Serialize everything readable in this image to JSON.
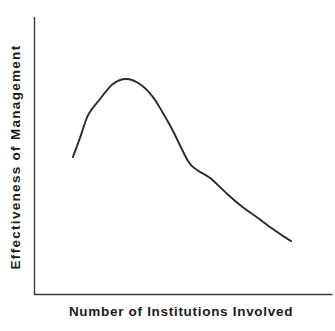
{
  "figure": {
    "background": "#ffffff",
    "curve_color": "#2b2b2b",
    "axis_color": "#3c3c3c",
    "text_color": "#1b1b1b"
  },
  "chart_data": {
    "type": "line",
    "title": "",
    "xlabel": "Number of Institutions Involved",
    "ylabel": "Effectiveness of Management",
    "x_ticks": [],
    "y_ticks": [],
    "xlim": [
      0,
      1
    ],
    "ylim": [
      0,
      1
    ],
    "grid": false,
    "legend": false,
    "series": [
      {
        "name": "effectiveness-vs-institutions",
        "points": [
          [
            0.13,
            0.496
          ],
          [
            0.154,
            0.565
          ],
          [
            0.181,
            0.647
          ],
          [
            0.221,
            0.705
          ],
          [
            0.264,
            0.759
          ],
          [
            0.308,
            0.777
          ],
          [
            0.354,
            0.759
          ],
          [
            0.398,
            0.712
          ],
          [
            0.431,
            0.655
          ],
          [
            0.465,
            0.59
          ],
          [
            0.515,
            0.482
          ],
          [
            0.545,
            0.45
          ],
          [
            0.589,
            0.421
          ],
          [
            0.639,
            0.371
          ],
          [
            0.689,
            0.324
          ],
          [
            0.749,
            0.277
          ],
          [
            0.799,
            0.237
          ],
          [
            0.833,
            0.212
          ],
          [
            0.86,
            0.194
          ]
        ]
      }
    ]
  }
}
